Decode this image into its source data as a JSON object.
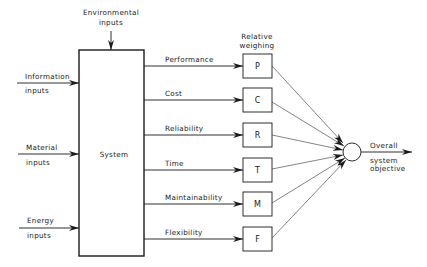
{
  "diagram": {
    "environmental_input": {
      "line1": "Environmental",
      "line2": "inputs"
    },
    "left_inputs": [
      {
        "line1": "Information",
        "line2": "inputs",
        "y": 83
      },
      {
        "line1": "Material",
        "line2": "inputs",
        "y": 154
      },
      {
        "line1": "Energy",
        "line2": "inputs",
        "y": 228
      }
    ],
    "system_label": "System",
    "weighing_header": {
      "line1": "Relative",
      "line2": "weighing"
    },
    "attributes": [
      {
        "label": "Performance",
        "letter": "P",
        "y": 66
      },
      {
        "label": "Cost",
        "letter": "C",
        "y": 100
      },
      {
        "label": "Reliability",
        "letter": "R",
        "y": 135
      },
      {
        "label": "Time",
        "letter": "T",
        "y": 170
      },
      {
        "label": "Maintainability",
        "letter": "M",
        "y": 204
      },
      {
        "label": "Flexibility",
        "letter": "F",
        "y": 239
      }
    ],
    "output": {
      "line1": "Overall",
      "line2": "system",
      "line3": "objective"
    },
    "colors": {
      "stroke": "#1a1a1a",
      "background": "#ffffff"
    }
  }
}
